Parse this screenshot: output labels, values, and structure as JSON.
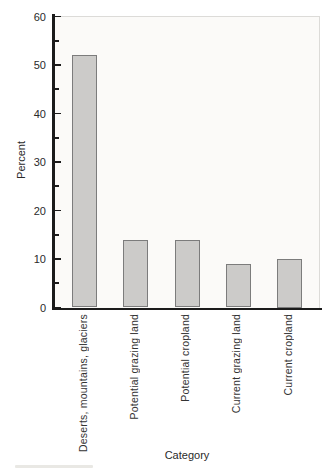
{
  "figure": {
    "background": "#ffffff",
    "plot_background": "#fbfaf8",
    "frame_border_color": "#dcdbd8",
    "axis_color": "#1b1b1b",
    "bar_fill": "#cccbc9",
    "bar_border": "#7c7c7c",
    "text_color": "#2a2a2a"
  },
  "chart_data": {
    "type": "bar",
    "title": "",
    "xlabel": "Category",
    "ylabel": "Percent",
    "categories": [
      "Deserts, mountains, glaciers",
      "Potential grazing land",
      "Potential cropland",
      "Current grazing land",
      "Current cropland"
    ],
    "values": [
      52,
      14,
      14,
      9,
      10
    ],
    "ylim": [
      0,
      60
    ],
    "ytick_major": [
      0,
      10,
      20,
      30,
      40,
      50,
      60
    ],
    "ytick_minor": [
      5,
      15,
      25,
      35,
      45,
      55
    ],
    "grid": false,
    "legend": false,
    "bar_orientation": "vertical",
    "xticklabel_rotation": 90
  }
}
